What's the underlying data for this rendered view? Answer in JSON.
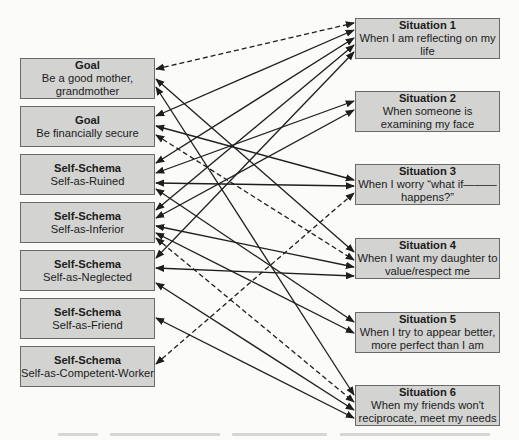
{
  "left_nodes": [
    {
      "id": "goal-mother",
      "type": "Goal",
      "label": "Be a good mother, grandmother",
      "x": 20,
      "y": 58,
      "w": 135,
      "h": 41
    },
    {
      "id": "goal-financial",
      "type": "Goal",
      "label": "Be financially secure",
      "x": 20,
      "y": 106,
      "w": 135,
      "h": 41
    },
    {
      "id": "ss-ruined",
      "type": "Self-Schema",
      "label": "Self-as-Ruined",
      "x": 20,
      "y": 154,
      "w": 135,
      "h": 41
    },
    {
      "id": "ss-inferior",
      "type": "Self-Schema",
      "label": "Self-as-Inferior",
      "x": 20,
      "y": 202,
      "w": 135,
      "h": 41
    },
    {
      "id": "ss-neglected",
      "type": "Self-Schema",
      "label": "Self-as-Neglected",
      "x": 20,
      "y": 250,
      "w": 135,
      "h": 41
    },
    {
      "id": "ss-friend",
      "type": "Self-Schema",
      "label": "Self-as-Friend",
      "x": 20,
      "y": 298,
      "w": 135,
      "h": 41
    },
    {
      "id": "ss-competent",
      "type": "Self-Schema",
      "label": "Self-as-Competent-Worker",
      "x": 20,
      "y": 346,
      "w": 135,
      "h": 41
    }
  ],
  "right_nodes": [
    {
      "id": "sit-1",
      "type": "Situation 1",
      "label": "When I am reflecting on my life",
      "x": 355,
      "y": 18,
      "w": 145,
      "h": 41
    },
    {
      "id": "sit-2",
      "type": "Situation 2",
      "label": "When someone is examining my face",
      "x": 355,
      "y": 91,
      "w": 145,
      "h": 41
    },
    {
      "id": "sit-3",
      "type": "Situation 3",
      "label": "When I worry “what if———happens?”",
      "x": 355,
      "y": 164,
      "w": 145,
      "h": 41
    },
    {
      "id": "sit-4",
      "type": "Situation 4",
      "label": "When I want my daughter to value/respect me",
      "x": 355,
      "y": 238,
      "w": 145,
      "h": 41
    },
    {
      "id": "sit-5",
      "type": "Situation 5",
      "label": "When I try to appear better, more perfect than I am",
      "x": 355,
      "y": 312,
      "w": 145,
      "h": 41
    },
    {
      "id": "sit-6",
      "type": "Situation 6",
      "label": "When my friends won't reciprocate, meet my needs",
      "x": 355,
      "y": 385,
      "w": 145,
      "h": 41
    }
  ],
  "edges": [
    {
      "from": "goal-mother",
      "to": "sit-1",
      "style": "dashed",
      "ly": 69,
      "ry": 23
    },
    {
      "from": "goal-mother",
      "to": "sit-4",
      "style": "solid",
      "ly": 79,
      "ry": 252
    },
    {
      "from": "goal-mother",
      "to": "sit-6",
      "style": "solid",
      "ly": 87,
      "ry": 395
    },
    {
      "from": "goal-financial",
      "to": "sit-1",
      "style": "solid",
      "ly": 116,
      "ry": 30
    },
    {
      "from": "goal-financial",
      "to": "sit-3",
      "style": "solid",
      "ly": 126,
      "ry": 180
    },
    {
      "from": "goal-financial",
      "to": "sit-4",
      "style": "dashed",
      "ly": 135,
      "ry": 260
    },
    {
      "from": "ss-ruined",
      "to": "sit-1",
      "style": "solid",
      "ly": 163,
      "ry": 38
    },
    {
      "from": "ss-ruined",
      "to": "sit-2",
      "style": "solid",
      "ly": 173,
      "ry": 101
    },
    {
      "from": "ss-ruined",
      "to": "sit-3",
      "style": "solid",
      "ly": 183,
      "ry": 186
    },
    {
      "from": "ss-ruined",
      "to": "sit-5",
      "style": "solid",
      "ly": 189,
      "ry": 322
    },
    {
      "from": "ss-inferior",
      "to": "sit-1",
      "style": "solid",
      "ly": 210,
      "ry": 45
    },
    {
      "from": "ss-inferior",
      "to": "sit-2",
      "style": "solid",
      "ly": 218,
      "ry": 110
    },
    {
      "from": "ss-inferior",
      "to": "sit-4",
      "style": "solid",
      "ly": 226,
      "ry": 267
    },
    {
      "from": "ss-inferior",
      "to": "sit-5",
      "style": "solid",
      "ly": 233,
      "ry": 333
    },
    {
      "from": "ss-inferior",
      "to": "sit-6",
      "style": "dashed",
      "ly": 238,
      "ry": 402
    },
    {
      "from": "ss-neglected",
      "to": "sit-1",
      "style": "solid",
      "ly": 258,
      "ry": 52
    },
    {
      "from": "ss-neglected",
      "to": "sit-4",
      "style": "solid",
      "ly": 268,
      "ry": 276
    },
    {
      "from": "ss-neglected",
      "to": "sit-6",
      "style": "solid",
      "ly": 283,
      "ry": 410
    },
    {
      "from": "ss-friend",
      "to": "sit-6",
      "style": "solid",
      "ly": 318,
      "ry": 418
    },
    {
      "from": "ss-competent",
      "to": "sit-3",
      "style": "dashed",
      "ly": 364,
      "ry": 193
    }
  ],
  "colors": {
    "box_fill": "#d3d3d2",
    "box_border": "#6a6a6a",
    "line": "#1e1e1e",
    "background": "#fbfbfa"
  }
}
